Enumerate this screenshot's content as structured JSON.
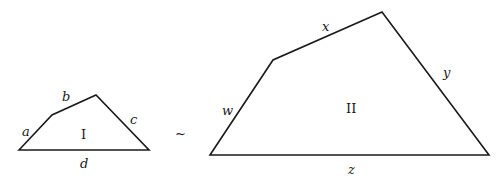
{
  "figure": {
    "similarity_symbol": "~",
    "shape_I": {
      "name": "I",
      "vertices": [
        [
          19,
          150
        ],
        [
          52,
          115
        ],
        [
          96,
          95
        ],
        [
          149,
          150
        ]
      ],
      "sides": {
        "a": "a",
        "b": "b",
        "c": "c",
        "d": "d"
      }
    },
    "shape_II": {
      "name": "II",
      "vertices": [
        [
          210,
          155
        ],
        [
          273,
          60
        ],
        [
          382,
          12
        ],
        [
          489,
          155
        ]
      ],
      "sides": {
        "w": "w",
        "x": "x",
        "y": "y",
        "z": "z"
      }
    }
  }
}
